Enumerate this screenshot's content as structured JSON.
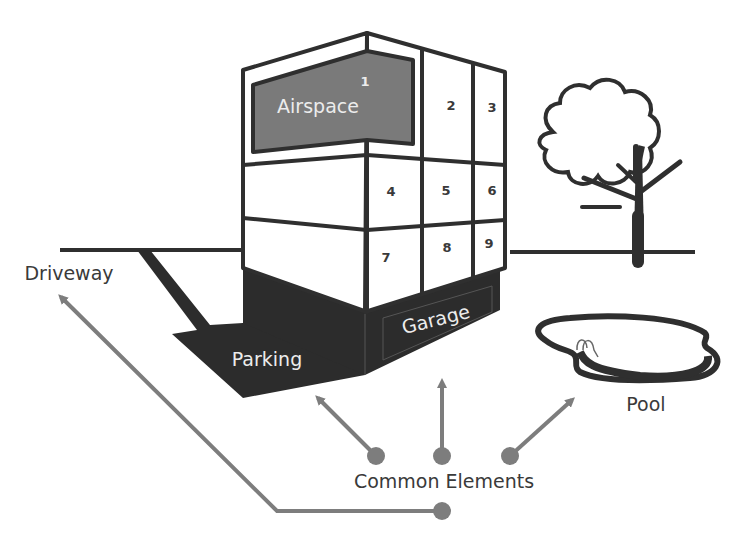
{
  "diagram": {
    "colors": {
      "outline": "#2f2f2f",
      "airspace_fill": "#7a7a7a",
      "ground_fill": "#2c2c2c",
      "connector": "#7d7d7d",
      "label_text": "#3a3a3a",
      "background": "#ffffff"
    },
    "units": [
      {
        "id": "1",
        "label": "1",
        "name": "Airspace"
      },
      {
        "id": "2",
        "label": "2"
      },
      {
        "id": "3",
        "label": "3"
      },
      {
        "id": "4",
        "label": "4"
      },
      {
        "id": "5",
        "label": "5"
      },
      {
        "id": "6",
        "label": "6"
      },
      {
        "id": "7",
        "label": "7"
      },
      {
        "id": "8",
        "label": "8"
      },
      {
        "id": "9",
        "label": "9"
      }
    ],
    "labels": {
      "airspace": "Airspace",
      "garage": "Garage",
      "parking": "Parking",
      "driveway": "Driveway",
      "pool": "Pool",
      "common_elements": "Common Elements"
    },
    "connectors": [
      {
        "from": "Common Elements",
        "to": "Parking"
      },
      {
        "from": "Common Elements",
        "to": "Garage"
      },
      {
        "from": "Common Elements",
        "to": "Pool"
      },
      {
        "from": "Common Elements",
        "to": "Driveway"
      }
    ]
  }
}
